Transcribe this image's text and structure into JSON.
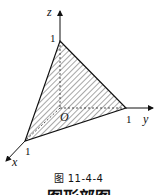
{
  "figure": {
    "axes": {
      "x": {
        "label": "x",
        "intercept_label": "1"
      },
      "y": {
        "label": "y",
        "intercept_label": "1"
      },
      "z": {
        "label": "z",
        "intercept_label": "1"
      },
      "origin_label": "O"
    },
    "shape": "hatched triangle (plane x + y + z = 1, first octant)",
    "caption": "图 11-4-4",
    "cutoff_text": "图形部图"
  }
}
